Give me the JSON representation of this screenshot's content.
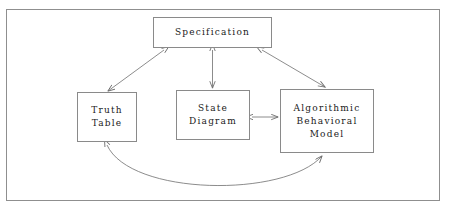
{
  "diagram": {
    "frame": {
      "stroke": "#8f8f8f",
      "background": "#ffffff"
    },
    "connector_color": "#6e6e6e",
    "text_color": "#1a1a1a",
    "nodes": [
      {
        "id": "specification",
        "label": "Specification",
        "lines": [
          "Specification"
        ]
      },
      {
        "id": "truth-table",
        "label": "Truth Table",
        "lines": [
          "Truth",
          "Table"
        ]
      },
      {
        "id": "state-diagram",
        "label": "State Diagram",
        "lines": [
          "State",
          "Diagram"
        ]
      },
      {
        "id": "algorithmic-behavioral-model",
        "label": "Algorithmic Behavioral Model",
        "lines": [
          "Algorithmic",
          "Behavioral",
          "Model"
        ]
      }
    ],
    "edges": [
      {
        "id": "spec-truth-table",
        "from": "specification",
        "to": "truth-table",
        "style": "straight",
        "arrowheads": "both"
      },
      {
        "id": "spec-state-diagram",
        "from": "specification",
        "to": "state-diagram",
        "style": "straight",
        "arrowheads": "both"
      },
      {
        "id": "spec-abm",
        "from": "specification",
        "to": "algorithmic-behavioral-model",
        "style": "straight",
        "arrowheads": "both"
      },
      {
        "id": "state-diagram-abm",
        "from": "state-diagram",
        "to": "algorithmic-behavioral-model",
        "style": "straight",
        "arrowheads": "both"
      },
      {
        "id": "truth-table-abm",
        "from": "truth-table",
        "to": "algorithmic-behavioral-model",
        "style": "curved",
        "arrowheads": "both"
      }
    ]
  }
}
